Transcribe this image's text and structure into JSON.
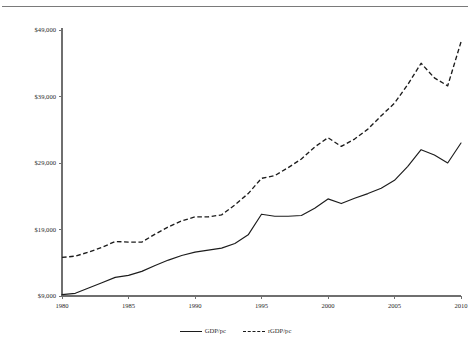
{
  "figure": {
    "top_strip_text": "",
    "background_color": "#ffffff",
    "line_color": "#1c1c1c",
    "axis_color": "#6f6f6f"
  },
  "legend": {
    "position": "bottom-center",
    "entries": [
      {
        "label": "GDP/pc",
        "style": "solid",
        "marker": "solid-line-swatch"
      },
      {
        "label": "rGDP/pc",
        "style": "dashed",
        "marker": "dashed-line-swatch"
      }
    ]
  },
  "axes": {
    "y_ticks": [
      "$9,000",
      "$19,000",
      "$29,000",
      "$39,000",
      "$49,000"
    ],
    "x_ticks": [
      "1980",
      "1985",
      "1990",
      "1995",
      "2000",
      "2005",
      "2010"
    ]
  },
  "chart_data": {
    "type": "line",
    "title": "",
    "subtitle": "",
    "xlabel": "",
    "ylabel": "",
    "xlim": [
      1980,
      2010
    ],
    "ylim": [
      9000,
      49000
    ],
    "grid": false,
    "legend_position": "bottom-center",
    "x_tick_values": [
      1980,
      1985,
      1990,
      1995,
      2000,
      2005,
      2010
    ],
    "y_tick_values": [
      9000,
      19000,
      29000,
      39000,
      49000
    ],
    "y_tick_labels": [
      "$9,000",
      "$19,000",
      "$29,000",
      "$39,000",
      "$49,000"
    ],
    "x": [
      1980,
      1981,
      1982,
      1983,
      1984,
      1985,
      1986,
      1987,
      1988,
      1989,
      1990,
      1991,
      1992,
      1993,
      1994,
      1995,
      1996,
      1997,
      1998,
      1999,
      2000,
      2001,
      2002,
      2003,
      2004,
      2005,
      2006,
      2007,
      2008,
      2009,
      2010
    ],
    "series": [
      {
        "name": "GDP/pc",
        "style": "solid",
        "values": [
          9200,
          9400,
          10200,
          11000,
          11800,
          12100,
          12700,
          13600,
          14400,
          15100,
          15600,
          15900,
          16200,
          16900,
          18200,
          21300,
          21000,
          21000,
          21100,
          22200,
          23600,
          22900,
          23700,
          24400,
          25200,
          26400,
          28500,
          31000,
          30200,
          29000,
          32000
        ]
      },
      {
        "name": "rGDP/pc",
        "style": "dashed",
        "values": [
          14800,
          15000,
          15600,
          16300,
          17200,
          17100,
          17100,
          18300,
          19400,
          20300,
          20900,
          20900,
          21200,
          22700,
          24400,
          26700,
          27100,
          28300,
          29600,
          31400,
          32800,
          31500,
          32600,
          34100,
          36100,
          38000,
          40800,
          44000,
          41800,
          40600,
          47200
        ]
      }
    ]
  }
}
